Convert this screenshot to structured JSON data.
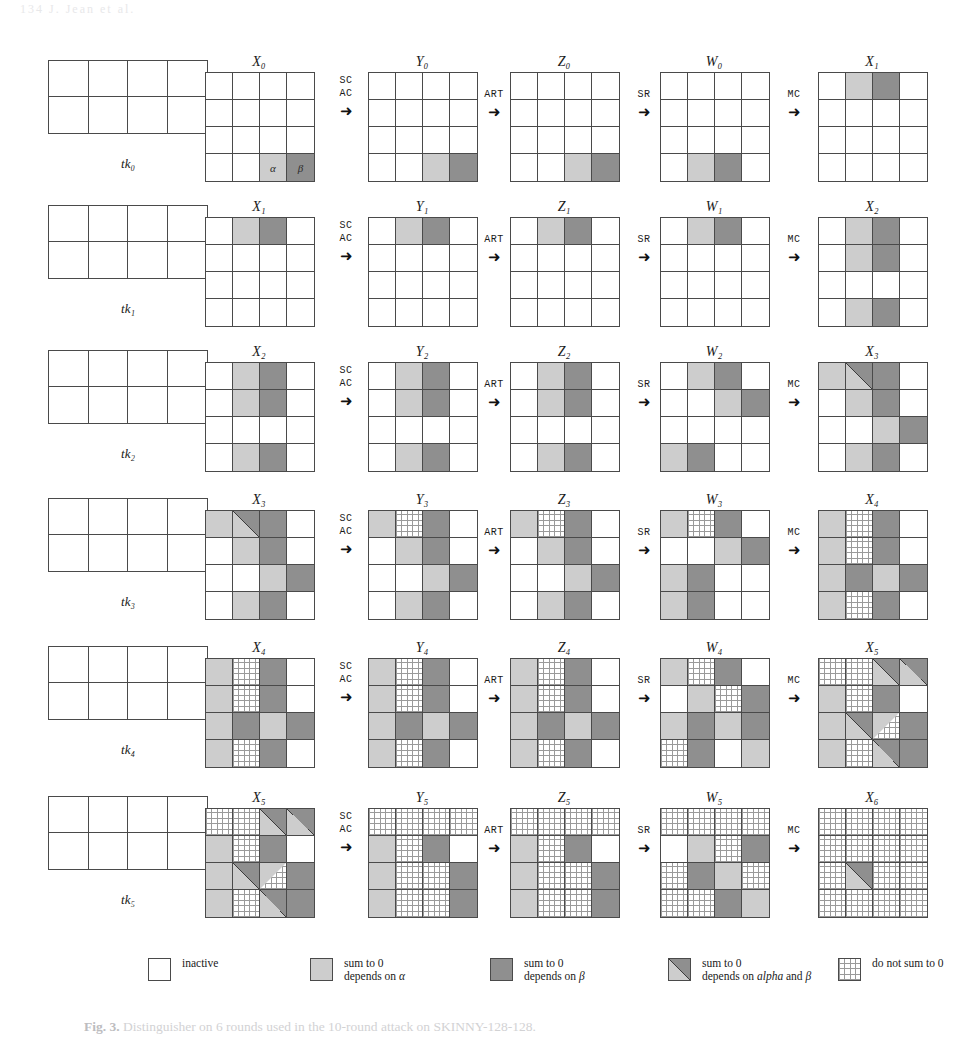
{
  "page_header": "134     J. Jean et al.",
  "caption": {
    "prefix": "Fig. 3.",
    "text": " Distinguisher on 6 rounds used in the 10-round attack on SKINNY-128-128."
  },
  "legend": {
    "items": [
      {
        "fill": "inactive",
        "lines": [
          "inactive"
        ]
      },
      {
        "fill": "light",
        "lines": [
          "sum to 0",
          "depends on α"
        ]
      },
      {
        "fill": "dark",
        "lines": [
          "sum to 0",
          "depends on β"
        ]
      },
      {
        "fill": "split",
        "lines": [
          "sum to 0",
          "depends on alpha and β"
        ]
      },
      {
        "fill": "hatch",
        "lines": [
          "do not sum to 0"
        ]
      }
    ]
  },
  "operations": {
    "sc_ac": {
      "line1": "SC",
      "line2": "AC",
      "arrow": "➜"
    },
    "art": {
      "line1": "ART",
      "line2": "",
      "arrow": "➜"
    },
    "sr": {
      "line1": "SR",
      "line2": "",
      "arrow": "➜"
    },
    "mc": {
      "line1": "MC",
      "line2": "",
      "arrow": "➜"
    }
  },
  "rows": [
    {
      "tweakey": {
        "label": "tk₀",
        "cells": [
          "w",
          "w",
          "w",
          "w",
          "w",
          "w",
          "w",
          "w"
        ]
      },
      "states": [
        {
          "label": "X₀",
          "cells": [
            "w",
            "w",
            "w",
            "w",
            "w",
            "w",
            "w",
            "w",
            "w",
            "w",
            "w",
            "w",
            "w",
            "w",
            "l",
            "d"
          ],
          "annotations": {
            "14": "α",
            "15": "β"
          }
        },
        {
          "label": "Y₀",
          "cells": [
            "w",
            "w",
            "w",
            "w",
            "w",
            "w",
            "w",
            "w",
            "w",
            "w",
            "w",
            "w",
            "w",
            "w",
            "l",
            "d"
          ]
        },
        {
          "label": "Z₀",
          "cells": [
            "w",
            "w",
            "w",
            "w",
            "w",
            "w",
            "w",
            "w",
            "w",
            "w",
            "w",
            "w",
            "w",
            "w",
            "l",
            "d"
          ]
        },
        {
          "label": "W₀",
          "cells": [
            "w",
            "w",
            "w",
            "w",
            "w",
            "w",
            "w",
            "w",
            "w",
            "w",
            "w",
            "w",
            "w",
            "l",
            "d",
            "w"
          ]
        },
        {
          "label": "X₁",
          "cells": [
            "w",
            "l",
            "d",
            "w",
            "w",
            "w",
            "w",
            "w",
            "w",
            "w",
            "w",
            "w",
            "w",
            "w",
            "w",
            "w"
          ]
        }
      ]
    },
    {
      "tweakey": {
        "label": "tk₁",
        "cells": [
          "w",
          "w",
          "w",
          "w",
          "w",
          "w",
          "w",
          "w"
        ]
      },
      "states": [
        {
          "label": "X₁",
          "cells": [
            "w",
            "l",
            "d",
            "w",
            "w",
            "w",
            "w",
            "w",
            "w",
            "w",
            "w",
            "w",
            "w",
            "w",
            "w",
            "w"
          ]
        },
        {
          "label": "Y₁",
          "cells": [
            "w",
            "l",
            "d",
            "w",
            "w",
            "w",
            "w",
            "w",
            "w",
            "w",
            "w",
            "w",
            "w",
            "w",
            "w",
            "w"
          ]
        },
        {
          "label": "Z₁",
          "cells": [
            "w",
            "l",
            "d",
            "w",
            "w",
            "w",
            "w",
            "w",
            "w",
            "w",
            "w",
            "w",
            "w",
            "w",
            "w",
            "w"
          ]
        },
        {
          "label": "W₁",
          "cells": [
            "w",
            "l",
            "d",
            "w",
            "w",
            "w",
            "w",
            "w",
            "w",
            "w",
            "w",
            "w",
            "w",
            "w",
            "w",
            "w"
          ]
        },
        {
          "label": "X₂",
          "cells": [
            "w",
            "l",
            "d",
            "w",
            "w",
            "l",
            "d",
            "w",
            "w",
            "w",
            "w",
            "w",
            "w",
            "l",
            "d",
            "w"
          ]
        }
      ]
    },
    {
      "tweakey": {
        "label": "tk₂",
        "cells": [
          "w",
          "w",
          "w",
          "w",
          "w",
          "w",
          "w",
          "w"
        ]
      },
      "states": [
        {
          "label": "X₂",
          "cells": [
            "w",
            "l",
            "d",
            "w",
            "w",
            "l",
            "d",
            "w",
            "w",
            "w",
            "w",
            "w",
            "w",
            "l",
            "d",
            "w"
          ]
        },
        {
          "label": "Y₂",
          "cells": [
            "w",
            "l",
            "d",
            "w",
            "w",
            "l",
            "d",
            "w",
            "w",
            "w",
            "w",
            "w",
            "w",
            "l",
            "d",
            "w"
          ]
        },
        {
          "label": "Z₂",
          "cells": [
            "w",
            "l",
            "d",
            "w",
            "w",
            "l",
            "d",
            "w",
            "w",
            "w",
            "w",
            "w",
            "w",
            "l",
            "d",
            "w"
          ]
        },
        {
          "label": "W₂",
          "cells": [
            "w",
            "l",
            "d",
            "w",
            "w",
            "w",
            "l",
            "d",
            "w",
            "w",
            "w",
            "w",
            "l",
            "d",
            "w",
            "w"
          ]
        },
        {
          "label": "X₃",
          "cells": [
            "l",
            "s",
            "d",
            "w",
            "w",
            "l",
            "d",
            "w",
            "w",
            "w",
            "l",
            "d",
            "w",
            "l",
            "d",
            "w"
          ]
        }
      ]
    },
    {
      "tweakey": {
        "label": "tk₃",
        "cells": [
          "w",
          "w",
          "w",
          "w",
          "w",
          "w",
          "w",
          "w"
        ]
      },
      "states": [
        {
          "label": "X₃",
          "cells": [
            "l",
            "s",
            "d",
            "w",
            "w",
            "l",
            "d",
            "w",
            "w",
            "w",
            "l",
            "d",
            "w",
            "l",
            "d",
            "w"
          ]
        },
        {
          "label": "Y₃",
          "cells": [
            "l",
            "h",
            "d",
            "w",
            "w",
            "l",
            "d",
            "w",
            "w",
            "w",
            "l",
            "d",
            "w",
            "l",
            "d",
            "w"
          ]
        },
        {
          "label": "Z₃",
          "cells": [
            "l",
            "h",
            "d",
            "w",
            "w",
            "l",
            "d",
            "w",
            "w",
            "w",
            "l",
            "d",
            "w",
            "l",
            "d",
            "w"
          ]
        },
        {
          "label": "W₃",
          "cells": [
            "l",
            "h",
            "d",
            "w",
            "w",
            "w",
            "l",
            "d",
            "l",
            "d",
            "w",
            "w",
            "l",
            "d",
            "w",
            "w"
          ]
        },
        {
          "label": "X₄",
          "cells": [
            "l",
            "h",
            "d",
            "w",
            "l",
            "h",
            "d",
            "w",
            "l",
            "d",
            "l",
            "d",
            "l",
            "h",
            "d",
            "w"
          ]
        }
      ]
    },
    {
      "tweakey": {
        "label": "tk₄",
        "cells": [
          "w",
          "w",
          "w",
          "w",
          "w",
          "w",
          "w",
          "w"
        ]
      },
      "states": [
        {
          "label": "X₄",
          "cells": [
            "l",
            "h",
            "d",
            "w",
            "l",
            "h",
            "d",
            "w",
            "l",
            "d",
            "l",
            "d",
            "l",
            "h",
            "d",
            "w"
          ]
        },
        {
          "label": "Y₄",
          "cells": [
            "l",
            "h",
            "d",
            "w",
            "l",
            "h",
            "d",
            "w",
            "l",
            "d",
            "l",
            "d",
            "l",
            "h",
            "d",
            "w"
          ]
        },
        {
          "label": "Z₄",
          "cells": [
            "l",
            "h",
            "d",
            "w",
            "l",
            "h",
            "d",
            "w",
            "l",
            "d",
            "l",
            "d",
            "l",
            "h",
            "d",
            "w"
          ]
        },
        {
          "label": "W₄",
          "cells": [
            "l",
            "h",
            "d",
            "w",
            "w",
            "l",
            "h",
            "d",
            "l",
            "d",
            "l",
            "d",
            "h",
            "d",
            "w",
            "l"
          ]
        },
        {
          "label": "X₅",
          "cells": [
            "h",
            "h",
            "s",
            "s",
            "l",
            "h",
            "d",
            "w",
            "l",
            "s",
            "sh",
            "d",
            "l",
            "h",
            "s",
            "d"
          ]
        }
      ]
    },
    {
      "tweakey": {
        "label": "tk₅",
        "cells": [
          "w",
          "w",
          "w",
          "w",
          "w",
          "w",
          "w",
          "w"
        ]
      },
      "states": [
        {
          "label": "X₅",
          "cells": [
            "h",
            "h",
            "s",
            "s",
            "l",
            "h",
            "d",
            "w",
            "l",
            "s",
            "sh",
            "d",
            "l",
            "h",
            "s",
            "d"
          ]
        },
        {
          "label": "Y₅",
          "cells": [
            "h",
            "h",
            "h",
            "h",
            "l",
            "h",
            "d",
            "w",
            "l",
            "h",
            "h",
            "d",
            "l",
            "h",
            "h",
            "d"
          ]
        },
        {
          "label": "Z₅",
          "cells": [
            "h",
            "h",
            "h",
            "h",
            "l",
            "h",
            "d",
            "w",
            "l",
            "h",
            "h",
            "d",
            "l",
            "h",
            "h",
            "d"
          ]
        },
        {
          "label": "W₅",
          "cells": [
            "h",
            "h",
            "h",
            "h",
            "w",
            "l",
            "h",
            "d",
            "h",
            "d",
            "l",
            "h",
            "h",
            "h",
            "d",
            "l"
          ]
        },
        {
          "label": "X₆",
          "cells": [
            "h",
            "h",
            "h",
            "h",
            "h",
            "h",
            "h",
            "h",
            "h",
            "s",
            "h",
            "h",
            "h",
            "h",
            "h",
            "h"
          ]
        }
      ]
    }
  ],
  "colors": {
    "inactive": "#ffffff",
    "light": "#cdcdcd",
    "dark": "#8f8f8f",
    "grid_line": "#4a4a4a"
  }
}
